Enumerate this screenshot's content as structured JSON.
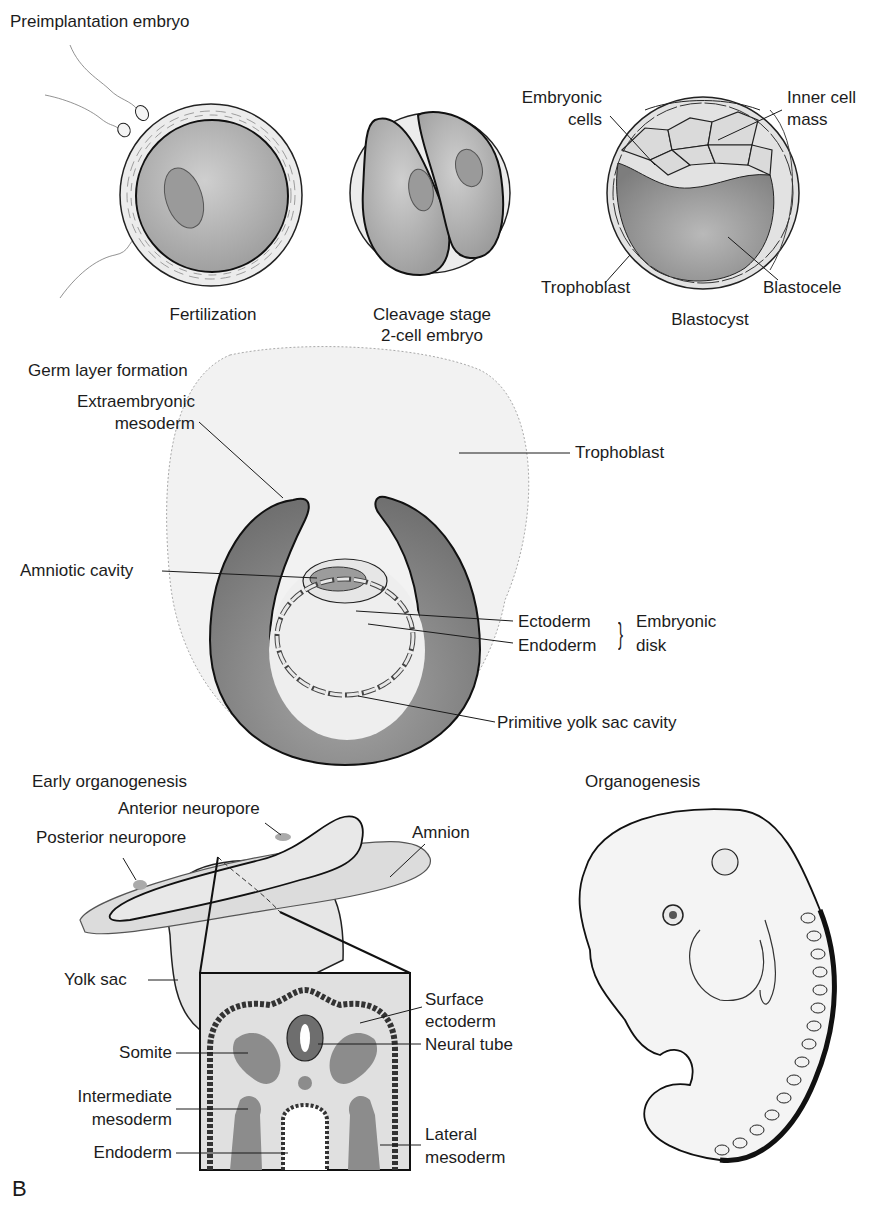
{
  "figure": {
    "panel_letter": "B",
    "colors": {
      "cell_fill": "#b4b4b4",
      "dark_fill": "#8a8a8a",
      "light_fill": "#e6e6e6",
      "zona_fill": "#ececec",
      "outline": "#1a1a1a",
      "background": "#ffffff"
    }
  },
  "preimplantation": {
    "section_title": "Preimplantation embryo",
    "fertilization": {
      "caption": "Fertilization"
    },
    "cleavage": {
      "caption_line1": "Cleavage stage",
      "caption_line2": "2-cell embryo"
    },
    "blastocyst": {
      "caption": "Blastocyst",
      "labels": {
        "embryonic_cells_1": "Embryonic",
        "embryonic_cells_2": "cells",
        "inner_cell_mass_1": "Inner cell",
        "inner_cell_mass_2": "mass",
        "trophoblast": "Trophoblast",
        "blastocele": "Blastocele"
      }
    }
  },
  "germ_layer": {
    "section_title": "Germ layer formation",
    "labels": {
      "extraembryonic_1": "Extraembryonic",
      "extraembryonic_2": "mesoderm",
      "trophoblast": "Trophoblast",
      "amniotic_cavity": "Amniotic cavity",
      "ectoderm": "Ectoderm",
      "endoderm": "Endoderm",
      "embryonic_disk_1": "Embryonic",
      "embryonic_disk_2": "disk",
      "primitive_yolk_sac": "Primitive yolk sac cavity"
    }
  },
  "early_organogenesis": {
    "section_title": "Early organogenesis",
    "labels": {
      "anterior_neuropore": "Anterior neuropore",
      "posterior_neuropore": "Posterior neuropore",
      "amnion": "Amnion",
      "yolk_sac": "Yolk sac",
      "surface_ectoderm_1": "Surface",
      "surface_ectoderm_2": "ectoderm",
      "neural_tube": "Neural tube",
      "somite": "Somite",
      "intermediate_1": "Intermediate",
      "intermediate_2": "mesoderm",
      "endoderm": "Endoderm",
      "lateral_1": "Lateral",
      "lateral_2": "mesoderm"
    }
  },
  "organogenesis": {
    "section_title": "Organogenesis"
  }
}
